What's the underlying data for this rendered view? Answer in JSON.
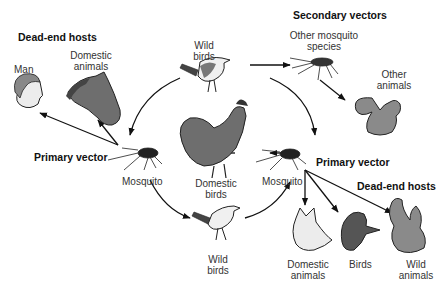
{
  "headings": {
    "dead_end_left": "Dead-end hosts",
    "secondary_vectors": "Secondary vectors",
    "primary_vector_left": "Primary vector",
    "primary_vector_right": "Primary vector",
    "dead_end_right": "Dead-end hosts"
  },
  "labels": {
    "man": "Man",
    "domestic_animals_top_1": "Domestic",
    "domestic_animals_top_2": "animals",
    "wild_birds_top_1": "Wild",
    "wild_birds_top_2": "birds",
    "other_mosquito_1": "Other mosquito",
    "other_mosquito_2": "species",
    "other_animals_1": "Other",
    "other_animals_2": "animals",
    "mosquito_left": "Mosquito",
    "domestic_birds_1": "Domestic",
    "domestic_birds_2": "birds",
    "mosquito_right": "Mosquito",
    "wild_birds_bottom_1": "Wild",
    "wild_birds_bottom_2": "birds",
    "domestic_animals_bottom_1": "Domestic",
    "domestic_animals_bottom_2": "animals",
    "birds": "Birds",
    "wild_animals_1": "Wild",
    "wild_animals_2": "animals"
  },
  "colors": {
    "ink": "#111111",
    "animal_dark": "#6e6e6e",
    "animal_mid": "#9a9a9a",
    "animal_light": "#e8e8e8"
  }
}
